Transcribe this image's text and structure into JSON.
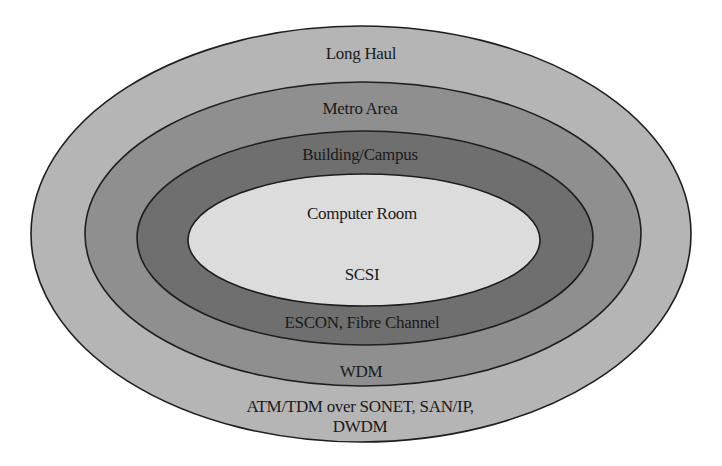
{
  "diagram": {
    "type": "nested-ellipses",
    "stroke_color": "#1e1e1e",
    "layers": [
      {
        "id": "long-haul",
        "title": "Long Haul",
        "technology": "ATM/TDM over SONET, SAN/IP,",
        "technology_line2": "DWDM",
        "fill": "#b5b5b5",
        "cx": 361,
        "cy": 234,
        "rx": 330,
        "ry": 208
      },
      {
        "id": "metro-area",
        "title": "Metro Area",
        "technology": "WDM",
        "fill": "#8f8f8f",
        "cx": 363,
        "cy": 234,
        "rx": 278,
        "ry": 152
      },
      {
        "id": "building-campus",
        "title": "Building/Campus",
        "technology": "ESCON, Fibre Channel",
        "fill": "#6f6f6f",
        "cx": 365,
        "cy": 238,
        "rx": 228,
        "ry": 107
      },
      {
        "id": "computer-room",
        "title": "Computer Room",
        "technology": "SCSI",
        "fill": "#dcdcdc",
        "cx": 364,
        "cy": 240,
        "rx": 176,
        "ry": 66
      }
    ]
  }
}
